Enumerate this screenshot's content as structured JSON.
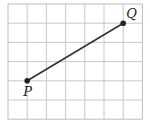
{
  "diagram": {
    "grid": {
      "cols": 7,
      "rows": 6,
      "origin_x": 8,
      "origin_y": 4,
      "cell": 19.2,
      "line_color": "#c8c8c8",
      "border_color": "#bdbdbd"
    },
    "segment": {
      "color": "#333333",
      "width": 1.6
    },
    "points": [
      {
        "label": "P",
        "col": 1,
        "row": 4,
        "label_dx": -4,
        "label_dy": 15
      },
      {
        "label": "Q",
        "col": 6,
        "row": 1,
        "label_dx": 3,
        "label_dy": -5
      }
    ]
  }
}
